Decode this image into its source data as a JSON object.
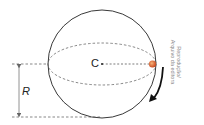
{
  "diagram": {
    "center_label": "C",
    "radius_label": "R",
    "credit_lines": [
      "Reprodução/",
      "Arquivo da editora"
    ],
    "colors": {
      "stroke": "#222222",
      "dashed": "#555555",
      "particle": "#d9602a",
      "radius_arrow": "#777777",
      "credit_text": "#8a8a8a"
    },
    "elements": [
      "sphere-outline",
      "equatorial-ellipse",
      "center-point",
      "radius-dimension",
      "particle",
      "rotation-arrow"
    ]
  }
}
